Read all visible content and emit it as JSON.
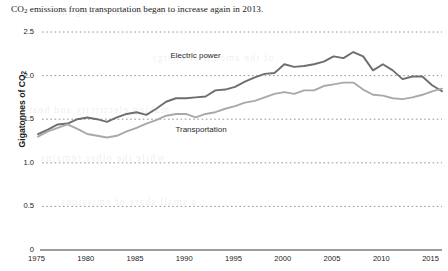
{
  "chart_data": {
    "type": "line",
    "title": "CO2 emissions from transportation began to increase again in 2013.",
    "title_parts": {
      "pre": "CO",
      "sub": "2",
      "post": " emissions from transportation began to increase again in 2013."
    },
    "xlabel": "",
    "ylabel": "Gigatonnes of CO2",
    "ylabel_parts": {
      "pre": "Gigatonnes of CO",
      "sub": "2"
    },
    "xlim": [
      1975,
      2016
    ],
    "ylim": [
      0,
      2.5
    ],
    "grid": "horizontal-dotted",
    "legend_position": "inline-annotation",
    "y_ticks": [
      "0",
      "0.5",
      "1.0",
      "1.5",
      "2.0",
      "2.5"
    ],
    "y_tick_values": [
      0,
      0.5,
      1.0,
      1.5,
      2.0,
      2.5
    ],
    "x_ticks": [
      "1975",
      "1980",
      "1985",
      "1990",
      "1995",
      "2000",
      "2005",
      "2010",
      "2015"
    ],
    "x_tick_values": [
      1975,
      1980,
      1985,
      1990,
      1995,
      2000,
      2005,
      2010,
      2015
    ],
    "series": [
      {
        "name": "Electric power",
        "color": "#6e6e6e",
        "label_x": 1991.5,
        "label_y": 2.22,
        "x": [
          1975,
          1976,
          1977,
          1978,
          1979,
          1980,
          1981,
          1982,
          1983,
          1984,
          1985,
          1986,
          1987,
          1988,
          1989,
          1990,
          1991,
          1992,
          1993,
          1994,
          1995,
          1996,
          1997,
          1998,
          1999,
          2000,
          2001,
          2002,
          2003,
          2004,
          2005,
          2006,
          2007,
          2008,
          2009,
          2010,
          2011,
          2012,
          2013,
          2014,
          2015,
          2016
        ],
        "values": [
          1.33,
          1.38,
          1.44,
          1.45,
          1.5,
          1.52,
          1.5,
          1.47,
          1.52,
          1.56,
          1.58,
          1.55,
          1.62,
          1.7,
          1.74,
          1.74,
          1.75,
          1.76,
          1.83,
          1.84,
          1.87,
          1.93,
          1.98,
          2.02,
          2.03,
          2.13,
          2.1,
          2.11,
          2.13,
          2.16,
          2.22,
          2.2,
          2.27,
          2.22,
          2.06,
          2.13,
          2.06,
          1.96,
          1.99,
          1.99,
          1.89,
          1.82
        ]
      },
      {
        "name": "Transportation",
        "color": "#a9a9a9",
        "label_x": 1992.0,
        "label_y": 1.38,
        "x": [
          1975,
          1976,
          1977,
          1978,
          1979,
          1980,
          1981,
          1982,
          1983,
          1984,
          1985,
          1986,
          1987,
          1988,
          1989,
          1990,
          1991,
          1992,
          1993,
          1994,
          1995,
          1996,
          1997,
          1998,
          1999,
          2000,
          2001,
          2002,
          2003,
          2004,
          2005,
          2006,
          2007,
          2008,
          2009,
          2010,
          2011,
          2012,
          2013,
          2014,
          2015,
          2016
        ],
        "values": [
          1.3,
          1.36,
          1.4,
          1.44,
          1.39,
          1.33,
          1.31,
          1.29,
          1.31,
          1.36,
          1.4,
          1.45,
          1.49,
          1.54,
          1.56,
          1.56,
          1.52,
          1.56,
          1.58,
          1.62,
          1.65,
          1.69,
          1.71,
          1.75,
          1.79,
          1.81,
          1.79,
          1.83,
          1.83,
          1.88,
          1.9,
          1.92,
          1.92,
          1.84,
          1.78,
          1.77,
          1.74,
          1.73,
          1.75,
          1.78,
          1.82,
          1.85
        ]
      }
    ]
  },
  "ghost_text": {
    "lines": [
      "the one and only thing that",
      "of the amount  of energy",
      "making electricity and heat",
      "while the other remains",
      "a small share of emissions"
    ]
  }
}
